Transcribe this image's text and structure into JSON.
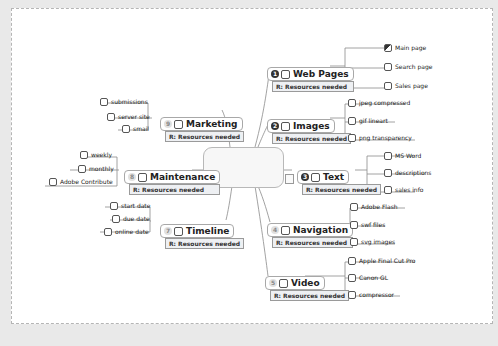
{
  "central_topic": {
    "label": ""
  },
  "topics": [
    {
      "id": "web-pages",
      "priority": "1",
      "priority_style": "dark",
      "label": "Web Pages",
      "resource": "R: Resources needed",
      "children": [
        {
          "label": "Main page",
          "state": "half"
        },
        {
          "label": "Search page",
          "state": "empty"
        },
        {
          "label": "Sales page",
          "state": "empty"
        }
      ]
    },
    {
      "id": "images",
      "priority": "2",
      "priority_style": "dark",
      "label": "Images",
      "resource": "R: Resources needed",
      "children": [
        {
          "label": "jpeg compressed",
          "state": "empty"
        },
        {
          "label": "gif lineart",
          "state": "empty"
        },
        {
          "label": "png transparency",
          "state": "empty"
        }
      ]
    },
    {
      "id": "text",
      "priority": "3",
      "priority_style": "dark",
      "label": "Text",
      "resource": "R: Resources needed",
      "children": [
        {
          "label": "MS Word",
          "state": "empty"
        },
        {
          "label": "descriptions",
          "state": "empty"
        },
        {
          "label": "sales info",
          "state": "empty"
        }
      ]
    },
    {
      "id": "navigation",
      "priority": "4",
      "priority_style": "light",
      "label": "Navigation",
      "resource": "R: Resources needed",
      "children": [
        {
          "label": "Adobe Flash",
          "state": "empty"
        },
        {
          "label": "swf files",
          "state": "empty"
        },
        {
          "label": "svg images",
          "state": "empty"
        }
      ]
    },
    {
      "id": "video",
      "priority": "5",
      "priority_style": "light",
      "label": "Video",
      "resource": "R: Resources needed",
      "children": [
        {
          "label": "Apple Final Cut Pro",
          "state": "empty"
        },
        {
          "label": "Canon GL",
          "state": "empty"
        },
        {
          "label": "compressor",
          "state": "empty"
        }
      ]
    },
    {
      "id": "marketing",
      "priority": "9",
      "priority_style": "light",
      "label": "Marketing",
      "resource": "R: Resources needed",
      "children": [
        {
          "label": "submissions",
          "state": "empty"
        },
        {
          "label": "server site",
          "state": "empty"
        },
        {
          "label": "smail",
          "state": "empty"
        }
      ]
    },
    {
      "id": "maintenance",
      "priority": "8",
      "priority_style": "light",
      "label": "Maintenance",
      "resource": "R: Resources needed",
      "children": [
        {
          "label": "weekly",
          "state": "empty"
        },
        {
          "label": "monthly",
          "state": "empty"
        },
        {
          "label": "Adobe Contribute",
          "state": "empty"
        }
      ]
    },
    {
      "id": "timeline",
      "priority": "7",
      "priority_style": "light",
      "label": "Timeline",
      "resource": "R: Resources needed",
      "children": [
        {
          "label": "start date",
          "state": "empty"
        },
        {
          "label": "due date",
          "state": "empty"
        },
        {
          "label": "online date",
          "state": "empty"
        }
      ]
    }
  ],
  "icons": {
    "note": "note-icon"
  },
  "colors": {
    "background": "#e9e9e9",
    "canvas": "#ffffff",
    "line": "#8a8a8a",
    "resource_bg": "#eef0f3"
  }
}
